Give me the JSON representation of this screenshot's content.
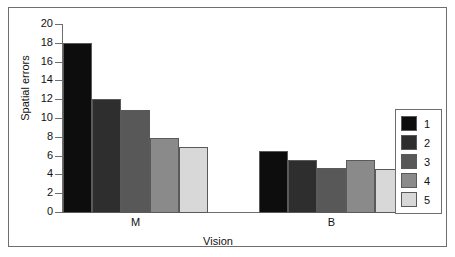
{
  "chart_data": {
    "type": "bar",
    "title": "",
    "xlabel": "Vision",
    "ylabel": "Spatial errors",
    "categories": [
      "M",
      "B"
    ],
    "ylim": [
      0,
      20
    ],
    "yticks": [
      0,
      2,
      4,
      6,
      8,
      10,
      12,
      14,
      16,
      18,
      20
    ],
    "ytick_labels": [
      "0",
      "2",
      "4",
      "6",
      "8",
      "10",
      "12",
      "14",
      "16",
      "18",
      "20"
    ],
    "grid": false,
    "legend_position": "right",
    "series": [
      {
        "name": "1",
        "color": "#0d0d0d",
        "values": [
          18.1,
          6.6
        ]
      },
      {
        "name": "2",
        "color": "#2e2e2e",
        "values": [
          12.1,
          5.6
        ]
      },
      {
        "name": "3",
        "color": "#585858",
        "values": [
          11.0,
          4.8
        ]
      },
      {
        "name": "4",
        "color": "#8a8a8a",
        "values": [
          8.0,
          5.6
        ]
      },
      {
        "name": "5",
        "color": "#d8d8d8",
        "values": [
          7.0,
          4.7
        ]
      }
    ]
  },
  "legend": {
    "entries": [
      {
        "label": "1",
        "color": "#0d0d0d"
      },
      {
        "label": "2",
        "color": "#2e2e2e"
      },
      {
        "label": "3",
        "color": "#585858"
      },
      {
        "label": "4",
        "color": "#8a8a8a"
      },
      {
        "label": "5",
        "color": "#d8d8d8"
      }
    ]
  }
}
